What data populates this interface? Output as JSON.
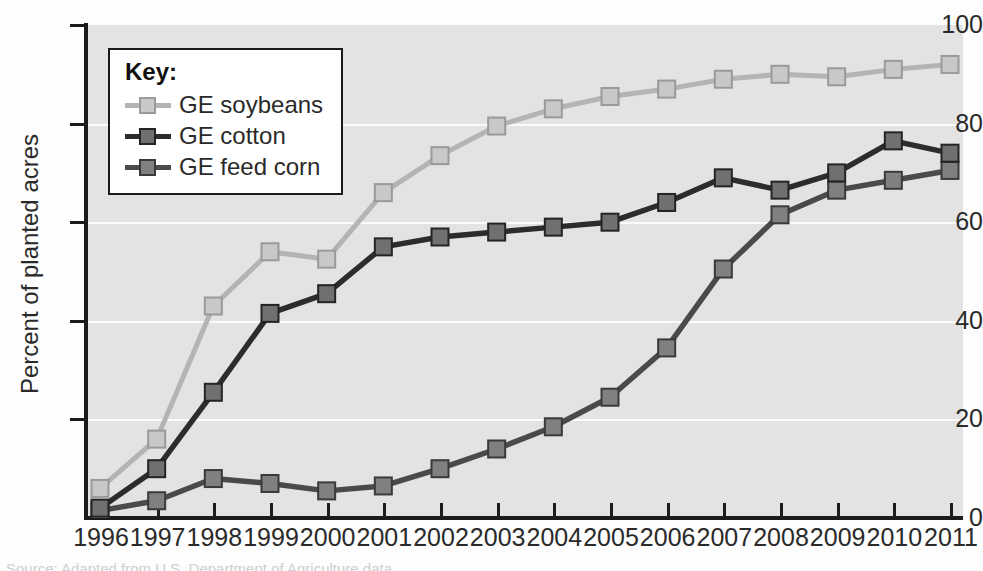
{
  "chart_data": {
    "type": "line",
    "title": "",
    "xlabel": "",
    "ylabel": "Percent of planted acres",
    "categories": [
      "1996",
      "1997",
      "1998",
      "1999",
      "2000",
      "2001",
      "2002",
      "2003",
      "2004",
      "2005",
      "2006",
      "2007",
      "2008",
      "2009",
      "2010",
      "2011"
    ],
    "x": [
      1996,
      1997,
      1998,
      1999,
      2000,
      2001,
      2002,
      2003,
      2004,
      2005,
      2006,
      2007,
      2008,
      2009,
      2010,
      2011
    ],
    "xlim": [
      1996,
      2011
    ],
    "ylim": [
      0,
      100
    ],
    "yticks": [
      0,
      20,
      40,
      60,
      80,
      100
    ],
    "ytick_labels": [
      "0",
      "20",
      "40",
      "60",
      "80",
      "100"
    ],
    "grid": true,
    "grid_axis": "y",
    "legend_position": "upper-left-inside",
    "legend_title": "Key:",
    "series": [
      {
        "name": "GE soybeans",
        "color": "#b4b4b4",
        "marker_fill": "#c8c8c8",
        "marker_edge": "#9a9a9a",
        "values": [
          6,
          16,
          43,
          54,
          52.5,
          66,
          73.5,
          79.5,
          83,
          85.5,
          87,
          89,
          90,
          89.5,
          91,
          92
        ]
      },
      {
        "name": "GE cotton",
        "color": "#2c2c2c",
        "marker_fill": "#707070",
        "marker_edge": "#242424",
        "values": [
          2,
          10,
          25.5,
          41.5,
          45.5,
          55,
          57,
          58,
          59,
          60,
          64,
          69,
          66.5,
          70,
          76.5,
          74
        ]
      },
      {
        "name": "GE feed corn",
        "color": "#4a4a4a",
        "marker_fill": "#808080",
        "marker_edge": "#3a3a3a",
        "values": [
          1.5,
          3.5,
          8,
          7,
          5.5,
          6.5,
          10,
          14,
          18.5,
          24.5,
          34.5,
          50.5,
          61.5,
          66.5,
          68.5,
          70.5
        ]
      }
    ]
  },
  "colors": {
    "plot_background": "#e3e3e3",
    "page_background": "#fdfdfd",
    "axis": "#1b1b1b",
    "gridline": "#fbfbfb",
    "text": "#2a2a2a",
    "legend_background": "#ffffff",
    "legend_border": "#1b1b1b"
  },
  "caption_sliver": "Source: Adapted from U.S. Department of Agriculture data"
}
